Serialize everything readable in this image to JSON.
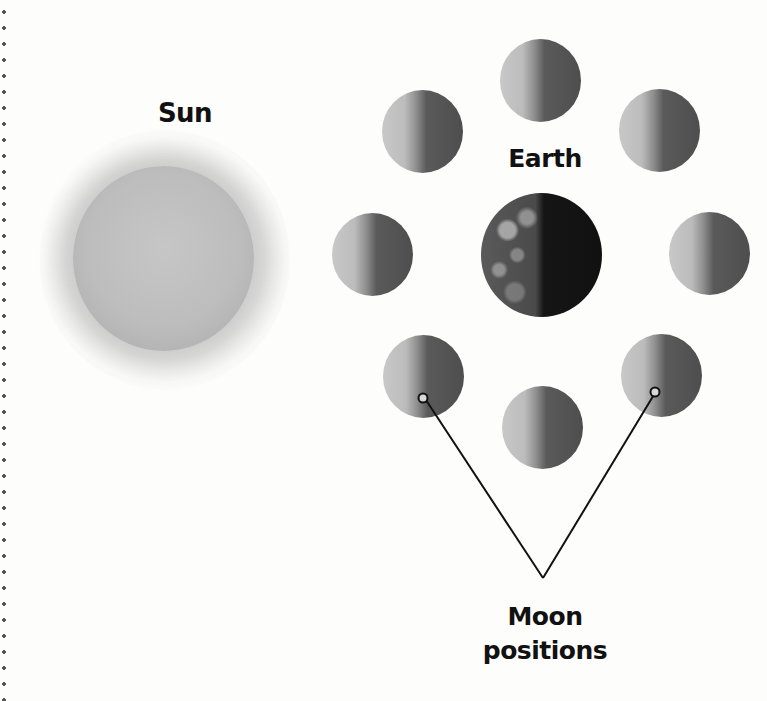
{
  "diagram": {
    "labels": {
      "sun": "Sun",
      "earth": "Earth",
      "moon_line1": "Moon",
      "moon_line2": "positions"
    },
    "bodies": {
      "sun": {
        "cx": 163,
        "cy": 258
      },
      "earth": {
        "cx": 541,
        "cy": 255
      },
      "moons": [
        {
          "position": "top",
          "cx": 541,
          "cy": 80
        },
        {
          "position": "top-right",
          "cx": 659,
          "cy": 131
        },
        {
          "position": "right",
          "cx": 709,
          "cy": 246
        },
        {
          "position": "bottom-right",
          "cx": 655,
          "cy": 372
        },
        {
          "position": "bottom",
          "cx": 541,
          "cy": 422
        },
        {
          "position": "bottom-left",
          "cx": 423,
          "cy": 372
        },
        {
          "position": "left",
          "cx": 373,
          "cy": 246
        },
        {
          "position": "top-left",
          "cx": 423,
          "cy": 131
        }
      ]
    },
    "colors": {
      "background": "#fdfdfc",
      "text": "#111111",
      "sun": "#bdbdbd",
      "moon_lit": "#c8c8c8",
      "moon_dark": "#4e4e4e",
      "earth_dark": "#111111"
    }
  }
}
